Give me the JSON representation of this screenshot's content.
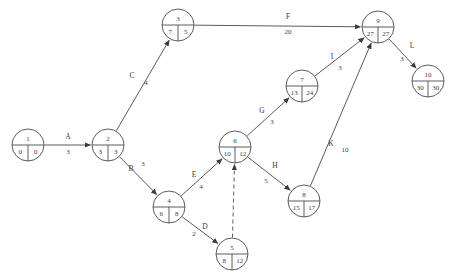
{
  "diagram": {
    "kind": "activity-on-arrow-network",
    "title": "",
    "colors": {
      "stroke": "#4a4a4a",
      "background": "#ffffff",
      "text": "#3a3a3a"
    },
    "nodes": [
      {
        "id": "1",
        "label": "1",
        "early": "0",
        "late": "0",
        "cx": 28,
        "cy": 145,
        "r": 16
      },
      {
        "id": "2",
        "label": "2",
        "early": "3",
        "late": "3",
        "cx": 108,
        "cy": 145,
        "r": 16
      },
      {
        "id": "3",
        "label": "3",
        "early": "7",
        "late": "5",
        "cx": 178,
        "cy": 25,
        "r": 16
      },
      {
        "id": "4",
        "label": "4",
        "early": "6",
        "late": "8",
        "cx": 169,
        "cy": 207,
        "r": 16
      },
      {
        "id": "5",
        "label": "5",
        "early": "8",
        "late": "12",
        "cx": 232,
        "cy": 254,
        "r": 16
      },
      {
        "id": "6",
        "label": "6",
        "early": "10",
        "late": "12",
        "cx": 235,
        "cy": 147,
        "r": 16
      },
      {
        "id": "7",
        "label": "7",
        "early": "13",
        "late": "24",
        "cx": 302,
        "cy": 86,
        "r": 16
      },
      {
        "id": "8",
        "label": "8",
        "early": "15",
        "late": "17",
        "cx": 304,
        "cy": 201,
        "r": 16
      },
      {
        "id": "9",
        "label": "9",
        "early": "27",
        "late": "27",
        "cx": 378,
        "cy": 27,
        "r": 16
      },
      {
        "id": "10",
        "label": "10",
        "early": "30",
        "late": "30",
        "cx": 428,
        "cy": 81,
        "r": 16
      }
    ],
    "edges": [
      {
        "id": "A",
        "label": "A",
        "weight": "3",
        "from": "1",
        "to": "2",
        "style": "solid",
        "label_x": 68,
        "label_y": 139,
        "weight_x": 68,
        "weight_y": 154
      },
      {
        "id": "C",
        "label": "C",
        "weight": "4",
        "from": "2",
        "to": "3",
        "style": "solid",
        "label_x": 132,
        "label_y": 78,
        "weight_x": 146,
        "weight_y": 85
      },
      {
        "id": "B",
        "label": "B",
        "weight": "3",
        "from": "2",
        "to": "4",
        "style": "solid",
        "label_x": 131,
        "label_y": 171,
        "weight_x": 143,
        "weight_y": 166
      },
      {
        "id": "F",
        "label": "F",
        "weight": "20",
        "from": "3",
        "to": "9",
        "style": "solid",
        "label_x": 288,
        "label_y": 19,
        "weight_x": 288,
        "weight_y": 34
      },
      {
        "id": "E",
        "label": "E",
        "weight": "4",
        "from": "4",
        "to": "6",
        "style": "solid",
        "label_x": 194,
        "label_y": 177,
        "weight_x": 201,
        "weight_y": 189
      },
      {
        "id": "D",
        "label": "D",
        "weight": "2",
        "from": "4",
        "to": "5",
        "style": "solid",
        "label_x": 205,
        "label_y": 229,
        "weight_x": 194,
        "weight_y": 236
      },
      {
        "id": "",
        "label": "",
        "weight": "",
        "from": "5",
        "to": "6",
        "style": "dashed",
        "label_x": 0,
        "label_y": 0,
        "weight_x": 0,
        "weight_y": 0
      },
      {
        "id": "G",
        "label": "G",
        "weight": "3",
        "from": "6",
        "to": "7",
        "style": "solid",
        "label_x": 262,
        "label_y": 113,
        "weight_x": 272,
        "weight_y": 124
      },
      {
        "id": "H",
        "label": "H",
        "weight": "5",
        "from": "6",
        "to": "8",
        "style": "solid",
        "label_x": 275,
        "label_y": 168,
        "weight_x": 266,
        "weight_y": 183
      },
      {
        "id": "I",
        "label": "I",
        "weight": "3",
        "from": "7",
        "to": "9",
        "style": "solid",
        "label_x": 332,
        "label_y": 59,
        "weight_x": 340,
        "weight_y": 70
      },
      {
        "id": "K",
        "label": "K",
        "weight": "10",
        "from": "8",
        "to": "9",
        "style": "solid",
        "label_x": 331,
        "label_y": 146,
        "weight_x": 345,
        "weight_y": 152
      },
      {
        "id": "L",
        "label": "L",
        "weight": "3",
        "from": "9",
        "to": "10",
        "style": "solid",
        "label_x": 412,
        "label_y": 48,
        "weight_x": 402,
        "weight_y": 61
      }
    ]
  }
}
